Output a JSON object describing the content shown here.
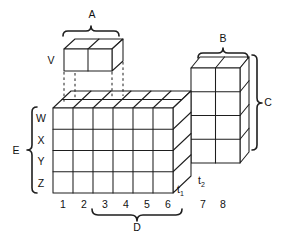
{
  "figure": {
    "type": "isometric-block-diagram",
    "background": "#ffffff",
    "line_color": "#1e1e1e",
    "text_color": "#111111"
  },
  "blocks": {
    "v": {
      "label": "V",
      "cols": 2,
      "rows": 1,
      "depth": 1
    },
    "main": {
      "cols": 6,
      "rows": 4,
      "depth": 2
    },
    "right": {
      "cols": 2,
      "rows": 4,
      "depth": 1
    }
  },
  "braces": {
    "a": "A",
    "b": "B",
    "c": "C",
    "d": "D",
    "e": "E"
  },
  "row_labels": [
    "W",
    "X",
    "Y",
    "Z"
  ],
  "column_labels": [
    "1",
    "2",
    "3",
    "4",
    "5",
    "6",
    "7",
    "8"
  ],
  "depth_labels": {
    "t1": {
      "base": "t",
      "sub": "1"
    },
    "t2": {
      "base": "t",
      "sub": "2"
    }
  }
}
